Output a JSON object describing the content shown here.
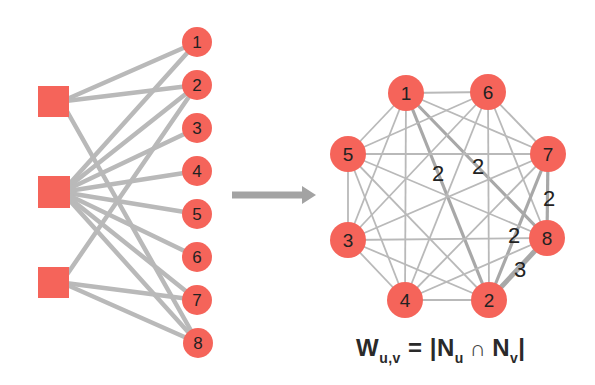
{
  "colors": {
    "node": "#F5645A",
    "edge": "#B9B9B9",
    "edge_heavy": "#A8A8A8",
    "arrow": "#A3A3A3",
    "label": "#222222",
    "background": "#FFFFFF"
  },
  "bipartite": {
    "groups": [
      {
        "id": "A",
        "x": 38,
        "y": 86,
        "size": 31
      },
      {
        "id": "B",
        "x": 38,
        "y": 176,
        "size": 32
      },
      {
        "id": "C",
        "x": 38,
        "y": 267,
        "size": 31
      }
    ],
    "items": [
      {
        "id": "1",
        "label": "1",
        "x": 197,
        "y": 42
      },
      {
        "id": "2",
        "label": "2",
        "x": 197,
        "y": 85
      },
      {
        "id": "3",
        "label": "3",
        "x": 197,
        "y": 128
      },
      {
        "id": "4",
        "label": "4",
        "x": 197,
        "y": 171
      },
      {
        "id": "5",
        "label": "5",
        "x": 197,
        "y": 214
      },
      {
        "id": "6",
        "label": "6",
        "x": 197,
        "y": 257
      },
      {
        "id": "7",
        "label": "7",
        "x": 197,
        "y": 300
      },
      {
        "id": "8",
        "label": "8",
        "x": 198,
        "y": 343
      }
    ],
    "edges": [
      [
        "A",
        "1"
      ],
      [
        "A",
        "2"
      ],
      [
        "A",
        "8"
      ],
      [
        "B",
        "1"
      ],
      [
        "B",
        "2"
      ],
      [
        "B",
        "3"
      ],
      [
        "B",
        "4"
      ],
      [
        "B",
        "5"
      ],
      [
        "B",
        "6"
      ],
      [
        "B",
        "7"
      ],
      [
        "B",
        "8"
      ],
      [
        "C",
        "2"
      ],
      [
        "C",
        "7"
      ],
      [
        "C",
        "8"
      ]
    ]
  },
  "arrow": {
    "x1": 232,
    "x2": 316,
    "y": 195
  },
  "projection": {
    "nodes": [
      {
        "id": "1",
        "label": "1",
        "x": 406,
        "y": 93
      },
      {
        "id": "6",
        "label": "6",
        "x": 488,
        "y": 92
      },
      {
        "id": "7",
        "label": "7",
        "x": 548,
        "y": 154
      },
      {
        "id": "8",
        "label": "8",
        "x": 547,
        "y": 238
      },
      {
        "id": "2",
        "label": "2",
        "x": 489,
        "y": 300
      },
      {
        "id": "4",
        "label": "4",
        "x": 405,
        "y": 300
      },
      {
        "id": "3",
        "label": "3",
        "x": 348,
        "y": 240
      },
      {
        "id": "5",
        "label": "5",
        "x": 348,
        "y": 154
      }
    ],
    "weighted_edges": [
      {
        "u": "1",
        "v": "2",
        "weight": "2",
        "lx": 438,
        "ly": 181
      },
      {
        "u": "1",
        "v": "8",
        "weight": "2",
        "lx": 478,
        "ly": 174
      },
      {
        "u": "7",
        "v": "8",
        "weight": "2",
        "lx": 549,
        "ly": 206
      },
      {
        "u": "2",
        "v": "7",
        "weight": "2",
        "lx": 514,
        "ly": 243
      },
      {
        "u": "2",
        "v": "8",
        "weight": "3",
        "lx": 520,
        "ly": 277
      }
    ],
    "complete": true
  },
  "formula": {
    "w": "W",
    "w_sub": "u,v",
    "eq": "= |N",
    "n1_sub": "u",
    "cap": "∩",
    "n2": "N",
    "n2_sub": "v",
    "close": "|"
  }
}
